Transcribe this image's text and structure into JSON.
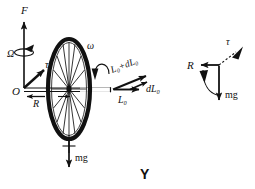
{
  "figure": {
    "caption": "Y",
    "background_color": "#ffffff",
    "ink_color": "#111111"
  },
  "left_diagram": {
    "name": "gyroscope-precession-diagram",
    "origin_label": "O",
    "vectors": [
      {
        "id": "F",
        "label": "F",
        "direction": "up",
        "style": "solid"
      },
      {
        "id": "Omega",
        "label": "Ω",
        "direction": "rotation-about-vertical",
        "style": "curved"
      },
      {
        "id": "tau",
        "label": "τ",
        "direction": "up-right",
        "style": "solid"
      },
      {
        "id": "R",
        "label": "R",
        "direction": "left",
        "style": "solid"
      },
      {
        "id": "omega",
        "label": "ω",
        "direction": "spin-about-axle",
        "style": "curved"
      },
      {
        "id": "L0",
        "label": "L₀",
        "direction": "right",
        "style": "solid"
      },
      {
        "id": "L0dL0",
        "label": "L₀+dL₀",
        "direction": "up-right",
        "style": "solid"
      },
      {
        "id": "dL0",
        "label": "dL₀",
        "direction": "right",
        "style": "solid"
      },
      {
        "id": "mg",
        "label": "mg",
        "direction": "down",
        "style": "solid"
      }
    ]
  },
  "right_diagram": {
    "name": "force-triad-diagram",
    "vectors": [
      {
        "id": "tau_r",
        "label": "τ",
        "direction": "up-right",
        "style": "dashed"
      },
      {
        "id": "R_r",
        "label": "R",
        "direction": "left",
        "style": "solid"
      },
      {
        "id": "mg_r",
        "label": "mg",
        "direction": "down",
        "style": "solid"
      }
    ]
  }
}
